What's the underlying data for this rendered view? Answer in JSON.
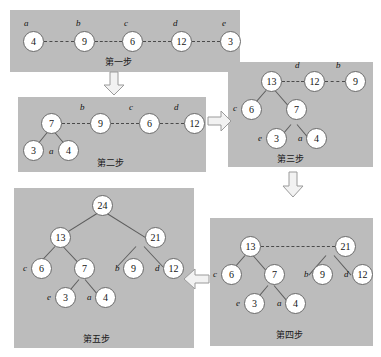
{
  "diagram": {
    "panel_color": "#bcbcbc",
    "node_fill": "#ffffff",
    "steps": [
      {
        "id": "step1",
        "caption": "第一步",
        "nodes": [
          {
            "value": "4",
            "label": "a"
          },
          {
            "value": "9",
            "label": "b"
          },
          {
            "value": "6",
            "label": "c"
          },
          {
            "value": "12",
            "label": "d"
          },
          {
            "value": "3",
            "label": "e"
          }
        ]
      },
      {
        "id": "step2",
        "caption": "第二步",
        "nodes": [
          {
            "value": "7",
            "label": ""
          },
          {
            "value": "9",
            "label": "b"
          },
          {
            "value": "6",
            "label": "c"
          },
          {
            "value": "12",
            "label": "d"
          },
          {
            "value": "3",
            "label": ""
          },
          {
            "value": "4",
            "label": "a"
          }
        ]
      },
      {
        "id": "step3",
        "caption": "第三步",
        "nodes": [
          {
            "value": "13",
            "label": ""
          },
          {
            "value": "12",
            "label": "d"
          },
          {
            "value": "9",
            "label": "b"
          },
          {
            "value": "6",
            "label": "c"
          },
          {
            "value": "7",
            "label": ""
          },
          {
            "value": "3",
            "label": "e"
          },
          {
            "value": "4",
            "label": "a"
          }
        ]
      },
      {
        "id": "step4",
        "caption": "第四步",
        "nodes": [
          {
            "value": "13",
            "label": ""
          },
          {
            "value": "21",
            "label": ""
          },
          {
            "value": "6",
            "label": "c"
          },
          {
            "value": "7",
            "label": ""
          },
          {
            "value": "9",
            "label": "b"
          },
          {
            "value": "12",
            "label": "d"
          },
          {
            "value": "3",
            "label": "e"
          },
          {
            "value": "4",
            "label": "a"
          }
        ]
      },
      {
        "id": "step5",
        "caption": "第五步",
        "nodes": [
          {
            "value": "24",
            "label": ""
          },
          {
            "value": "13",
            "label": ""
          },
          {
            "value": "21",
            "label": ""
          },
          {
            "value": "6",
            "label": "c"
          },
          {
            "value": "7",
            "label": ""
          },
          {
            "value": "9",
            "label": "b"
          },
          {
            "value": "12",
            "label": "d"
          },
          {
            "value": "3",
            "label": "e"
          },
          {
            "value": "4",
            "label": "a"
          }
        ]
      }
    ]
  },
  "s1": {
    "n1": "4",
    "n2": "9",
    "n3": "6",
    "n4": "12",
    "n5": "3",
    "l1": "a",
    "l2": "b",
    "l3": "c",
    "l4": "d",
    "l5": "e",
    "caption": "第一步"
  },
  "s2": {
    "n1": "7",
    "n2": "9",
    "n3": "6",
    "n4": "12",
    "n5": "3",
    "n6": "4",
    "l2": "b",
    "l3": "c",
    "l4": "d",
    "l6": "a",
    "caption": "第二步"
  },
  "s3": {
    "n1": "13",
    "n2": "12",
    "n3": "9",
    "n4": "6",
    "n5": "7",
    "n6": "3",
    "n7": "4",
    "l2": "d",
    "l3": "b",
    "l4": "c",
    "l6": "e",
    "l7": "a",
    "caption": "第三步"
  },
  "s4": {
    "n1": "13",
    "n2": "21",
    "n3": "6",
    "n4": "7",
    "n5": "9",
    "n6": "12",
    "n7": "3",
    "n8": "4",
    "l3": "c",
    "l5": "b",
    "l6": "d",
    "l7": "e",
    "l8": "a",
    "caption": "第四步"
  },
  "s5": {
    "n1": "24",
    "n2": "13",
    "n3": "21",
    "n4": "6",
    "n5": "7",
    "n6": "9",
    "n7": "12",
    "n8": "3",
    "n9": "4",
    "l4": "c",
    "l6": "b",
    "l7": "d",
    "l8": "e",
    "l9": "a",
    "caption": "第五步"
  }
}
